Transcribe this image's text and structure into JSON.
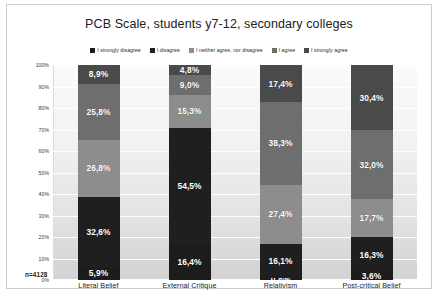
{
  "chart_data": {
    "type": "bar",
    "subtype": "100% stacked column",
    "title": "PCB Scale, students y7-12, secondary colleges",
    "xlabel": "",
    "ylabel": "",
    "ylim": [
      0,
      100
    ],
    "ytick_labels": [
      "100%",
      "90%",
      "80%",
      "70%",
      "60%",
      "50%",
      "40%",
      "30%",
      "20%",
      "10%",
      "0%"
    ],
    "ytick_values": [
      100,
      90,
      80,
      70,
      60,
      50,
      40,
      30,
      20,
      10,
      0
    ],
    "grid": true,
    "legend_position": "top",
    "sample_size_label": "n=4128",
    "categories": [
      "Literal Belief",
      "External Critique",
      "Relativism",
      "Post-critical Belief"
    ],
    "series": [
      {
        "name": "I strongly disagree",
        "color": "#1c1c1c",
        "values": [
          5.9,
          16.4,
          0.8,
          3.6
        ],
        "labels": [
          "5,9%",
          "16,4%",
          "0,8%",
          "3,6%"
        ]
      },
      {
        "name": "I disagree",
        "color": "#1f1f1f",
        "values": [
          32.6,
          54.5,
          16.1,
          16.3
        ],
        "labels": [
          "32,6%",
          "54,5%",
          "16,1%",
          "16,3%"
        ]
      },
      {
        "name": "I neither agree, nor disagree",
        "color": "#8d8d8d",
        "values": [
          26.8,
          15.3,
          27.4,
          17.7
        ],
        "labels": [
          "26,8%",
          "15,3%",
          "27,4%",
          "17,7%"
        ]
      },
      {
        "name": "I agree",
        "color": "#6e6e6e",
        "values": [
          25.8,
          9.0,
          38.3,
          32.0
        ],
        "labels": [
          "25,8%",
          "9,0%",
          "38,3%",
          "32,0%"
        ]
      },
      {
        "name": "I strongly agree",
        "color": "#4a4a4a",
        "values": [
          8.9,
          4.8,
          17.4,
          30.4
        ],
        "labels": [
          "8,9%",
          "4,8%",
          "17,4%",
          "30,4%"
        ]
      }
    ]
  },
  "legend": {
    "items": [
      {
        "label": "I strongly disagree",
        "color": "#1c1c1c"
      },
      {
        "label": "I disagree",
        "color": "#1f1f1f"
      },
      {
        "label": "I neither agree, nor disagree",
        "color": "#8d8d8d"
      },
      {
        "label": "I agree",
        "color": "#6e6e6e"
      },
      {
        "label": "I strongly agree",
        "color": "#4a4a4a"
      }
    ]
  },
  "caption": ""
}
